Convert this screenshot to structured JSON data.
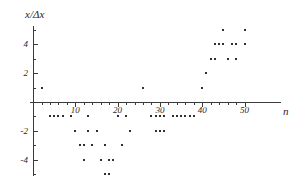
{
  "chart_data": {
    "type": "scatter",
    "title": "",
    "xlabel": "n",
    "ylabel": "x/Δx",
    "xlim": [
      -1,
      52
    ],
    "ylim": [
      -5.6,
      5.4
    ],
    "grid": false,
    "legend": null,
    "xticks_major": [
      10,
      20,
      30,
      40,
      50
    ],
    "xtick_labels": [
      "10",
      "20",
      "30",
      "40",
      "50"
    ],
    "yticks_major": [
      4,
      2,
      -2,
      -4
    ],
    "ytick_labels": [
      "4",
      "2",
      "-2",
      "-4"
    ],
    "xticks_minor": [
      2,
      4,
      6,
      8,
      12,
      14,
      16,
      18,
      22,
      24,
      26,
      28,
      32,
      34,
      36,
      38,
      42,
      44,
      46,
      48
    ],
    "yticks_minor": [
      5,
      3,
      1,
      -1,
      -3,
      -5
    ],
    "points": [
      {
        "n": 2,
        "v": 1
      },
      {
        "n": 4,
        "v": -1
      },
      {
        "n": 5,
        "v": -1
      },
      {
        "n": 6,
        "v": -1
      },
      {
        "n": 7,
        "v": -1
      },
      {
        "n": 9,
        "v": -1
      },
      {
        "n": 10,
        "v": -2
      },
      {
        "n": 11,
        "v": -3
      },
      {
        "n": 12,
        "v": -3
      },
      {
        "n": 12,
        "v": -4
      },
      {
        "n": 13,
        "v": -2
      },
      {
        "n": 13,
        "v": -1
      },
      {
        "n": 14,
        "v": -3
      },
      {
        "n": 15,
        "v": -2
      },
      {
        "n": 16,
        "v": -4
      },
      {
        "n": 17,
        "v": -3
      },
      {
        "n": 17,
        "v": -5
      },
      {
        "n": 18,
        "v": -4
      },
      {
        "n": 18,
        "v": -5
      },
      {
        "n": 19,
        "v": -4
      },
      {
        "n": 20,
        "v": -1
      },
      {
        "n": 21,
        "v": -3
      },
      {
        "n": 22,
        "v": -1
      },
      {
        "n": 23,
        "v": -2
      },
      {
        "n": 26,
        "v": 1
      },
      {
        "n": 28,
        "v": -1
      },
      {
        "n": 29,
        "v": -1
      },
      {
        "n": 29,
        "v": -2
      },
      {
        "n": 30,
        "v": -1
      },
      {
        "n": 30,
        "v": -2
      },
      {
        "n": 31,
        "v": -1
      },
      {
        "n": 31,
        "v": -2
      },
      {
        "n": 33,
        "v": -1
      },
      {
        "n": 34,
        "v": -1
      },
      {
        "n": 35,
        "v": -1
      },
      {
        "n": 36,
        "v": -1
      },
      {
        "n": 37,
        "v": -1
      },
      {
        "n": 38,
        "v": -1
      },
      {
        "n": 40,
        "v": 1
      },
      {
        "n": 41,
        "v": 2
      },
      {
        "n": 42,
        "v": 3
      },
      {
        "n": 43,
        "v": 4
      },
      {
        "n": 43,
        "v": 3
      },
      {
        "n": 44,
        "v": 4
      },
      {
        "n": 45,
        "v": 5
      },
      {
        "n": 45,
        "v": 4
      },
      {
        "n": 46,
        "v": 3
      },
      {
        "n": 47,
        "v": 4
      },
      {
        "n": 48,
        "v": 4
      },
      {
        "n": 48,
        "v": 3
      },
      {
        "n": 50,
        "v": 5
      },
      {
        "n": 50,
        "v": 4
      }
    ]
  }
}
